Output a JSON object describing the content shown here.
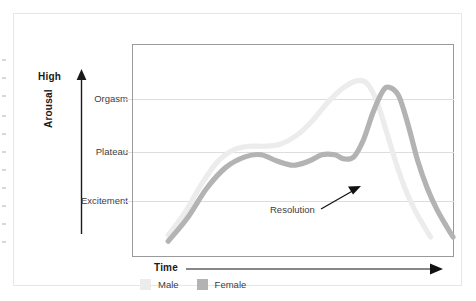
{
  "figure": {
    "name": "sexual-response-cycle-chart",
    "background": "#ffffff",
    "card_border": "#e7e7e7",
    "frame_border": "#9a9a9a",
    "grid_color": "#dddddd"
  },
  "axes": {
    "y_top_label": "High",
    "y_title": "Arousal",
    "x_title": "Time",
    "y_ticks": [
      "Orgasm",
      "Plateau",
      "Excitement"
    ]
  },
  "legend": {
    "items": [
      {
        "label": "Male",
        "color": "#ececec"
      },
      {
        "label": "Female",
        "color": "#b3b3b3"
      }
    ]
  },
  "annotations": [
    {
      "text": "Resolution",
      "target": "male-curve-descent"
    }
  ],
  "chart_data": {
    "type": "line",
    "title": "",
    "subtitle": "",
    "xlabel": "Time",
    "ylabel": "Arousal",
    "grid": true,
    "legend_position": "bottom",
    "xlim": [
      0,
      100
    ],
    "ylim": [
      0,
      100
    ],
    "ytick_labels": [
      "Excitement",
      "Plateau",
      "Orgasm",
      "High"
    ],
    "ytick_values": [
      26,
      49,
      72,
      100
    ],
    "annotations": [
      {
        "text": "Resolution",
        "label_x": 46,
        "label_y": 18,
        "arrow_to_x": 69,
        "arrow_to_y": 31
      }
    ],
    "series": [
      {
        "name": "Male",
        "color": "#ececec",
        "points": [
          [
            11,
            10
          ],
          [
            16,
            20
          ],
          [
            21,
            33
          ],
          [
            26,
            44
          ],
          [
            31,
            50
          ],
          [
            36,
            52
          ],
          [
            41,
            52
          ],
          [
            46,
            53
          ],
          [
            51,
            57
          ],
          [
            56,
            64
          ],
          [
            61,
            73
          ],
          [
            66,
            80
          ],
          [
            70,
            83
          ],
          [
            73,
            82
          ],
          [
            76,
            74
          ],
          [
            79,
            60
          ],
          [
            82,
            45
          ],
          [
            85,
            32
          ],
          [
            88,
            22
          ],
          [
            91,
            14
          ],
          [
            93,
            9
          ]
        ]
      },
      {
        "name": "Female",
        "color": "#b3b3b3",
        "points": [
          [
            11,
            7
          ],
          [
            17,
            18
          ],
          [
            23,
            32
          ],
          [
            29,
            42
          ],
          [
            35,
            47
          ],
          [
            40,
            48
          ],
          [
            45,
            45
          ],
          [
            50,
            43
          ],
          [
            55,
            45
          ],
          [
            59,
            48
          ],
          [
            63,
            48
          ],
          [
            66,
            46
          ],
          [
            69,
            47
          ],
          [
            72,
            55
          ],
          [
            75,
            68
          ],
          [
            78,
            78
          ],
          [
            80,
            80
          ],
          [
            83,
            76
          ],
          [
            86,
            62
          ],
          [
            89,
            45
          ],
          [
            92,
            32
          ],
          [
            95,
            22
          ],
          [
            98,
            14
          ],
          [
            100,
            9
          ]
        ]
      }
    ]
  }
}
